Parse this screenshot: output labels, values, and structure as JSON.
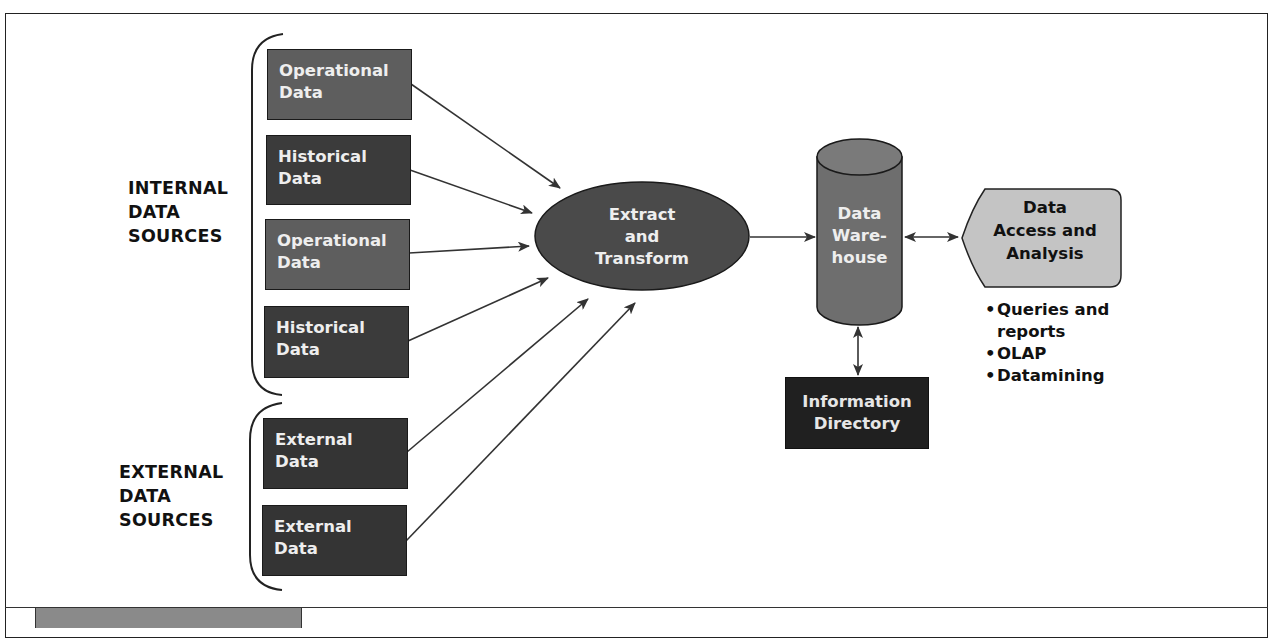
{
  "diagram": {
    "groups": {
      "internal": {
        "label_lines": [
          "INTERNAL",
          "DATA",
          "SOURCES"
        ]
      },
      "external": {
        "label_lines": [
          "EXTERNAL",
          "DATA",
          "SOURCES"
        ]
      }
    },
    "sources": [
      {
        "line1": "Operational",
        "line2": "Data",
        "group": "internal"
      },
      {
        "line1": "Historical",
        "line2": "Data",
        "group": "internal"
      },
      {
        "line1": "Operational",
        "line2": "Data",
        "group": "internal"
      },
      {
        "line1": "Historical",
        "line2": "Data",
        "group": "internal"
      },
      {
        "line1": "External",
        "line2": "Data",
        "group": "external"
      },
      {
        "line1": "External",
        "line2": "Data",
        "group": "external"
      }
    ],
    "process": {
      "lines": [
        "Extract",
        "and",
        "Transform"
      ]
    },
    "warehouse": {
      "lines": [
        "Data",
        "Ware-",
        "house"
      ]
    },
    "directory": {
      "lines": [
        "Information",
        "Directory"
      ]
    },
    "access": {
      "lines": [
        "Data",
        "Access and",
        "Analysis"
      ],
      "bullets": [
        {
          "line1": "Queries and",
          "line2": "reports"
        },
        {
          "line1": "OLAP"
        },
        {
          "line1": "Datamining"
        }
      ],
      "bullet_glyph": "•"
    },
    "colors": {
      "operational_box": "#5e5e5e",
      "historical_box": "#3b3b3b",
      "external_box": "#343434",
      "ellipse": "#4a4a4a",
      "cylinder": "#6e6e6e",
      "directory_box": "#202020",
      "access_shape": "#c4c4c4",
      "footer_tab": "#8a8a8a"
    }
  }
}
